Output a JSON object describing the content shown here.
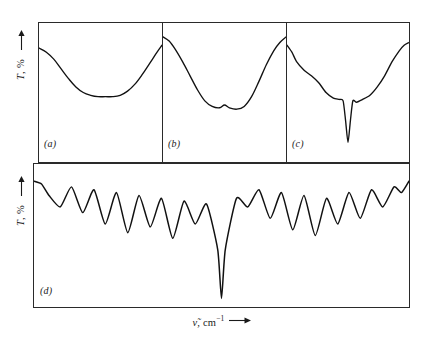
{
  "figure": {
    "axis": {
      "y_label_symbol": "T",
      "y_label_unit": ", %",
      "y_label_full": "T, %",
      "x_label_symbol": "ν̃",
      "x_label_unit": ", cm",
      "x_label_exponent": "−1",
      "x_label_full": "ν̃, cm⁻¹",
      "y_arrow_direction": "up",
      "x_arrow_direction": "right"
    },
    "panels": [
      {
        "id": "a",
        "tag": "(a)"
      },
      {
        "id": "b",
        "tag": "(b)"
      },
      {
        "id": "c",
        "tag": "(c)"
      },
      {
        "id": "d",
        "tag": "(d)"
      }
    ],
    "colors": {
      "trace": "#111111",
      "frame": "#2a2a2a",
      "background": "#ffffff",
      "text": "#1a1a1a"
    }
  },
  "chart_data": [
    {
      "type": "line",
      "panel": "a",
      "title": "(a)",
      "xlabel": "ν̃, cm⁻¹",
      "ylabel": "T, %",
      "grid": false,
      "legend": "none",
      "xlim": [
        0,
        100
      ],
      "ylim": [
        0,
        100
      ],
      "description": "Lowest resolution: single broad shallow absorption band with flat minimum",
      "x": [
        0,
        6,
        12,
        18,
        24,
        30,
        36,
        42,
        48,
        54,
        60,
        66,
        72,
        78,
        84,
        90,
        96,
        100
      ],
      "y": [
        82,
        79,
        74,
        67,
        60,
        54,
        50,
        48,
        47,
        47,
        47,
        48,
        51,
        56,
        63,
        71,
        79,
        84
      ]
    },
    {
      "type": "line",
      "panel": "b",
      "title": "(b)",
      "xlabel": "ν̃, cm⁻¹",
      "ylabel": "T, %",
      "grid": false,
      "legend": "none",
      "xlim": [
        0,
        100
      ],
      "ylim": [
        0,
        100
      ],
      "description": "Moderate resolution: broad band begins to show a small central hump between two minima",
      "x": [
        0,
        5,
        10,
        16,
        22,
        28,
        34,
        40,
        46,
        50,
        54,
        60,
        66,
        72,
        78,
        84,
        90,
        95,
        100
      ],
      "y": [
        90,
        87,
        81,
        72,
        62,
        52,
        44,
        40,
        39,
        41,
        39,
        38,
        40,
        47,
        58,
        70,
        80,
        86,
        90
      ]
    },
    {
      "type": "line",
      "panel": "c",
      "title": "(c)",
      "xlabel": "ν̃, cm⁻¹",
      "ylabel": "T, %",
      "grid": false,
      "legend": "none",
      "xlim": [
        0,
        100
      ],
      "ylim": [
        0,
        100
      ],
      "description": "Higher resolution: shoulders resolve into plateaus and a very narrow intense central line appears",
      "x": [
        0,
        4,
        8,
        14,
        20,
        26,
        32,
        38,
        43,
        46,
        48,
        50,
        52,
        54,
        57,
        62,
        68,
        74,
        80,
        86,
        92,
        96,
        100
      ],
      "y": [
        84,
        79,
        72,
        66,
        62,
        57,
        50,
        46,
        45,
        44,
        30,
        14,
        30,
        44,
        43,
        45,
        48,
        54,
        62,
        72,
        80,
        84,
        86
      ]
    },
    {
      "type": "line",
      "panel": "d",
      "title": "(d)",
      "xlabel": "ν̃, cm⁻¹",
      "ylabel": "T, %",
      "grid": false,
      "legend": "none",
      "xlim": [
        0,
        100
      ],
      "ylim": [
        0,
        100
      ],
      "description": "Highest resolution: full rotational fine structure of P and R branches with a very deep narrow central Q branch",
      "line_count": 18,
      "central_line_index": 9,
      "peak_transmittance": 88,
      "minimum_transmittance": 6,
      "x": [
        0,
        2,
        4,
        7,
        10,
        13,
        16,
        19,
        22,
        25,
        28,
        31,
        34,
        37,
        40,
        43,
        46,
        49,
        50,
        51,
        54,
        57,
        60,
        63,
        66,
        69,
        72,
        75,
        78,
        81,
        84,
        87,
        90,
        93,
        96,
        98,
        100
      ],
      "y": [
        88,
        86,
        78,
        70,
        84,
        66,
        82,
        58,
        80,
        52,
        78,
        56,
        76,
        48,
        74,
        58,
        72,
        40,
        6,
        40,
        76,
        70,
        82,
        62,
        80,
        54,
        78,
        50,
        76,
        58,
        80,
        62,
        82,
        70,
        84,
        80,
        88
      ]
    }
  ]
}
